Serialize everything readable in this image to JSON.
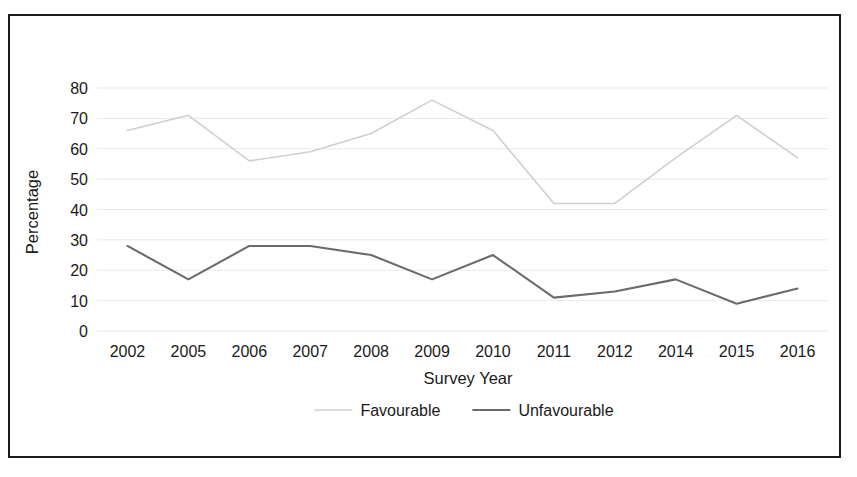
{
  "chart_data": {
    "type": "line",
    "title": "",
    "subtitle": "",
    "xlabel": "Survey Year",
    "ylabel": "Percentage",
    "categories": [
      "2002",
      "2005",
      "2006",
      "2007",
      "2008",
      "2009",
      "2010",
      "2011",
      "2012",
      "2014",
      "2015",
      "2016"
    ],
    "series": [
      {
        "name": "Favourable",
        "color": "#cfcfcf",
        "values": [
          66,
          71,
          56,
          59,
          65,
          76,
          66,
          42,
          42,
          57,
          71,
          57
        ]
      },
      {
        "name": "Unfavourable",
        "color": "#6b6b6b",
        "values": [
          28,
          17,
          28,
          28,
          25,
          17,
          25,
          11,
          13,
          17,
          9,
          14
        ]
      }
    ],
    "ylim": [
      0,
      80
    ],
    "yticks": [
      0,
      10,
      20,
      30,
      40,
      50,
      60,
      70,
      80
    ],
    "ytick_labels": [
      "0",
      "10",
      "20",
      "30",
      "40",
      "50",
      "60",
      "70",
      "80"
    ],
    "grid": true,
    "grid_axis": "y",
    "legend_position": "bottom",
    "legend": [
      "Favourable",
      "Unfavourable"
    ]
  },
  "axes": {
    "y_title": "Percentage",
    "x_title": "Survey Year"
  },
  "legend": {
    "items": [
      {
        "label": "Favourable",
        "swatch": "line-swatch-light"
      },
      {
        "label": "Unfavourable",
        "swatch": "line-swatch-dark"
      }
    ]
  },
  "colors": {
    "favourable": "#cfcfcf",
    "unfavourable": "#6b6b6b",
    "gridline": "#e9e9e9",
    "frame": "#1c1c1c",
    "text": "#1a1a1a",
    "background": "#ffffff"
  }
}
